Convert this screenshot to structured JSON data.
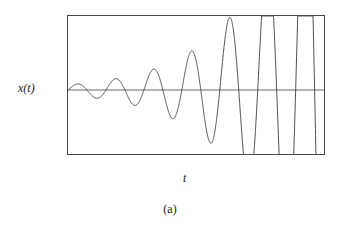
{
  "figure": {
    "caption": "(a)",
    "y_axis_label": "x(t)",
    "x_axis_label": "t",
    "line_color": "#3a3a3a",
    "frame_color": "#4a4a4a",
    "background_color": "#ffffff",
    "zero_line_color": "#5a5a5a"
  },
  "chart_data": {
    "type": "line",
    "title": "",
    "subtitle": "",
    "xlabel": "t",
    "ylabel": "x(t)",
    "legend": [],
    "legend_position": "none",
    "grid": false,
    "axis_ticks": false,
    "tick_labels": {
      "x": [],
      "y": []
    },
    "xlim": [
      0,
      6.8
    ],
    "ylim": [
      -1.15,
      1.15
    ],
    "zero_line": 0,
    "series": [
      {
        "name": "x(t)",
        "model": "growing-sinusoid",
        "equation": "x(t) = A0 * exp(g*t) * sin(2*pi*f*t), clipped at +/-1",
        "initial_amplitude": 0.07,
        "growth_rate": 0.62,
        "frequency_cycles_per_unit": 1.0,
        "cycles_visible": 6.8,
        "clipped": true,
        "clip_level": 1.0,
        "peaks_t": [
          0.27,
          1.16,
          2.05,
          3.0,
          4.0,
          5.0,
          6.0
        ],
        "peaks_value": [
          0.09,
          0.25,
          0.62,
          1.0,
          1.0,
          1.0,
          1.0
        ],
        "troughs_t": [
          0.72,
          1.6,
          2.5,
          3.5,
          4.5,
          5.5,
          6.5
        ],
        "troughs_value": [
          -0.16,
          -0.42,
          -0.9,
          -1.0,
          -1.0,
          -1.0,
          -1.0
        ]
      }
    ]
  }
}
